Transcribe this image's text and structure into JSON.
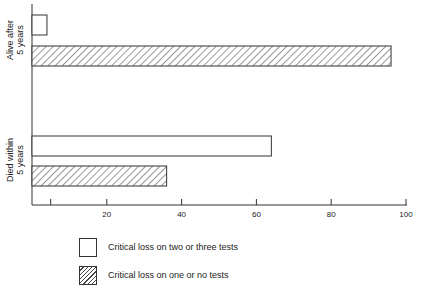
{
  "chart_data": {
    "type": "bar",
    "orientation": "horizontal",
    "title": "",
    "xlabel": "",
    "ylabel": "",
    "xlim": [
      0,
      100
    ],
    "x_ticks": [
      5,
      20,
      40,
      60,
      80,
      100
    ],
    "x_tick_labels": [
      "",
      "20",
      "40",
      "60",
      "80",
      "100"
    ],
    "grid": false,
    "categories": [
      "Alive after 5 years",
      "Died within 5 years"
    ],
    "category_label_lines": [
      [
        "Alive after",
        "5 years"
      ],
      [
        "Died within",
        "5 years"
      ]
    ],
    "series": [
      {
        "name": "Critical loss on two or three tests",
        "fill": "white",
        "values": [
          4,
          64
        ]
      },
      {
        "name": "Critical loss on one or no tests",
        "fill": "hatched",
        "values": [
          96,
          36
        ]
      }
    ],
    "legend_position": "bottom"
  },
  "legend": {
    "items": [
      {
        "label": "Critical loss on two or three tests",
        "style": "white"
      },
      {
        "label": "Critical loss on one or no tests",
        "style": "hatched"
      }
    ]
  },
  "colors": {
    "ink": "#333333",
    "background": "#ffffff"
  }
}
